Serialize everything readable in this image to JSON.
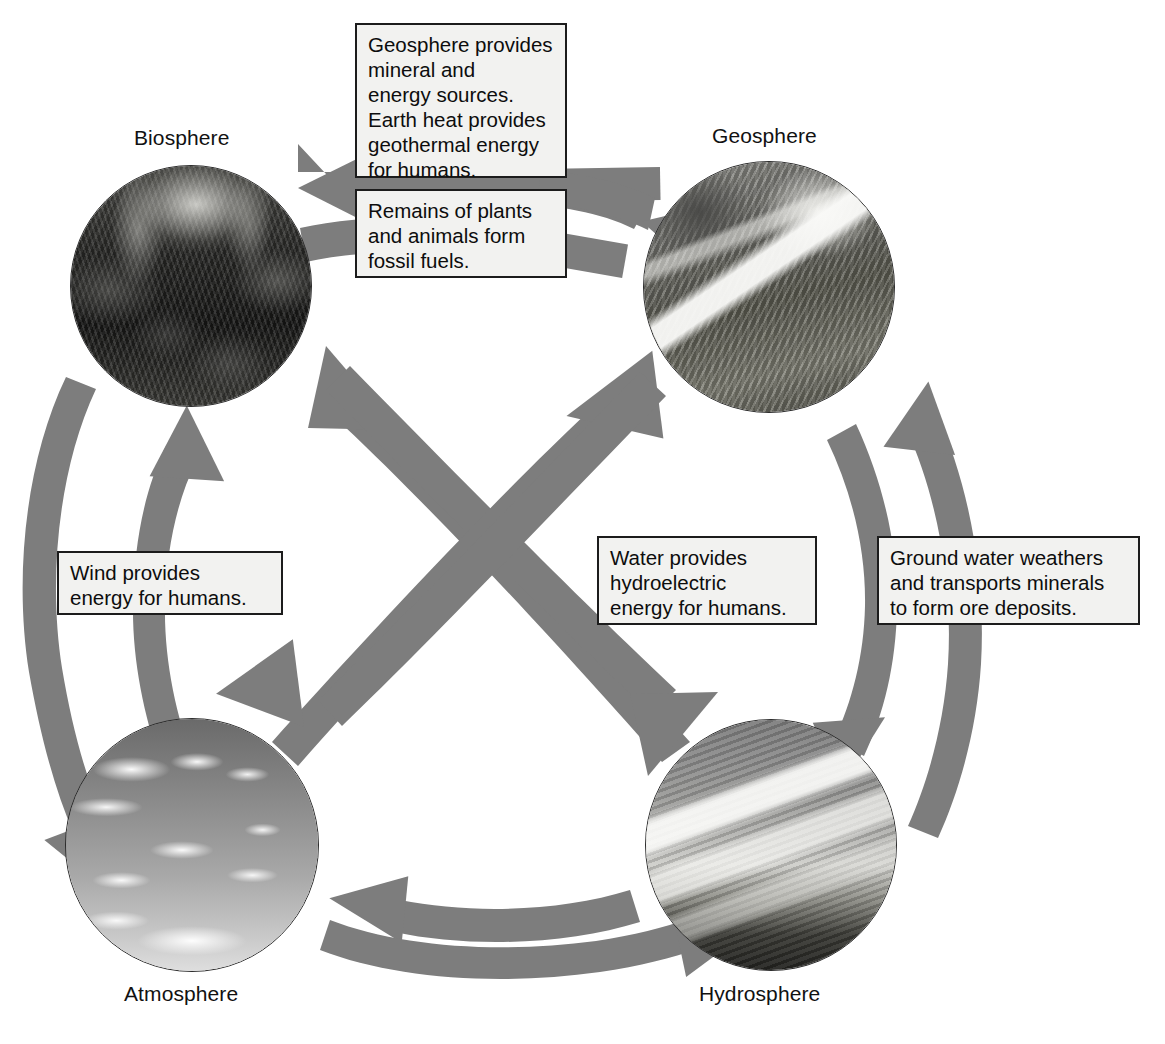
{
  "diagram": {
    "arrow_color": "#7d7d7d",
    "note_fill": "#f2f2f0",
    "note_border": "#1c1c1c",
    "spheres": [
      {
        "id": "biosphere",
        "label": "Biosphere",
        "image": "rainforest-canopy-photo",
        "cx": 191,
        "cy": 286,
        "r": 121
      },
      {
        "id": "geosphere",
        "label": "Geosphere",
        "image": "snowy-mountain-photo",
        "cx": 769,
        "cy": 287,
        "r": 126
      },
      {
        "id": "atmosphere",
        "label": "Atmosphere",
        "image": "clouds-in-sky-photo",
        "cx": 192,
        "cy": 845,
        "r": 127
      },
      {
        "id": "hydrosphere",
        "label": "Hydrosphere",
        "image": "ocean-shoreline-photo",
        "cx": 771,
        "cy": 845,
        "r": 126
      }
    ],
    "notes": [
      {
        "id": "geosphere-to-biosphere",
        "text": "Geosphere provides\nmineral and\nenergy sources.\nEarth heat provides\ngeothermal energy\nfor humans.",
        "from": "geosphere",
        "to": "biosphere"
      },
      {
        "id": "biosphere-to-geosphere",
        "text": "Remains of plants\nand animals form\nfossil fuels.",
        "from": "biosphere",
        "to": "geosphere"
      },
      {
        "id": "atmosphere-to-biosphere",
        "text": "Wind provides\nenergy for humans.",
        "from": "atmosphere",
        "to": "biosphere"
      },
      {
        "id": "hydrosphere-to-biosphere",
        "text": "Water provides\nhydroelectric\nenergy for humans.",
        "from": "hydrosphere",
        "to": "biosphere"
      },
      {
        "id": "hydrosphere-to-geosphere",
        "text": "Ground water weathers\nand transports minerals\nto form ore deposits.",
        "from": "hydrosphere",
        "to": "geosphere"
      }
    ],
    "arrows": [
      {
        "id": "geosphere-to-biosphere-arrow",
        "from": "Geosphere",
        "to": "Biosphere"
      },
      {
        "id": "biosphere-to-geosphere-arrow",
        "from": "Biosphere",
        "to": "Geosphere"
      },
      {
        "id": "atmosphere-to-biosphere-arrow",
        "from": "Atmosphere",
        "to": "Biosphere"
      },
      {
        "id": "biosphere-to-atmosphere-arrow",
        "from": "Biosphere",
        "to": "Atmosphere"
      },
      {
        "id": "hydrosphere-to-geosphere-arrow",
        "from": "Hydrosphere",
        "to": "Geosphere"
      },
      {
        "id": "geosphere-to-hydrosphere-arrow",
        "from": "Geosphere",
        "to": "Hydrosphere"
      },
      {
        "id": "hydrosphere-to-biosphere-arrow",
        "from": "Hydrosphere",
        "to": "Biosphere"
      },
      {
        "id": "biosphere-to-hydrosphere-arrow",
        "from": "Biosphere",
        "to": "Hydrosphere"
      },
      {
        "id": "atmosphere-to-geosphere-arrow",
        "from": "Atmosphere",
        "to": "Geosphere"
      },
      {
        "id": "geosphere-to-atmosphere-arrow",
        "from": "Geosphere",
        "to": "Atmosphere"
      },
      {
        "id": "hydrosphere-to-atmosphere-arrow",
        "from": "Hydrosphere",
        "to": "Atmosphere"
      },
      {
        "id": "atmosphere-to-hydrosphere-arrow",
        "from": "Atmosphere",
        "to": "Hydrosphere"
      }
    ]
  }
}
